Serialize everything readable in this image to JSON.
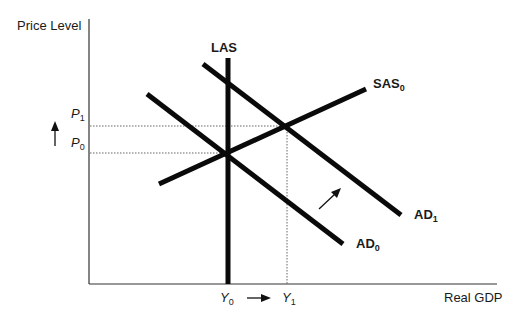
{
  "diagram": {
    "type": "AD-AS model",
    "axes": {
      "y_label": "Price Level",
      "x_label": "Real GDP"
    },
    "curves": {
      "las": {
        "label": "LAS"
      },
      "sas0": {
        "label": "SAS",
        "sub": "0"
      },
      "ad0": {
        "label": "AD",
        "sub": "0"
      },
      "ad1": {
        "label": "AD",
        "sub": "1"
      }
    },
    "price_levels": {
      "p0": {
        "label": "P",
        "sub": "0"
      },
      "p1": {
        "label": "P",
        "sub": "1"
      }
    },
    "output_levels": {
      "y0": {
        "label": "Y",
        "sub": "0"
      },
      "y1": {
        "label": "Y",
        "sub": "1"
      }
    },
    "annotations": {
      "price_increase_arrow": "up-arrow",
      "output_increase_arrow": "right-arrow",
      "demand_shift_arrow": "up-right-arrow"
    },
    "colors": {
      "line": "#0a0a0a",
      "axis": "#333333",
      "dotted": "#555555"
    }
  }
}
